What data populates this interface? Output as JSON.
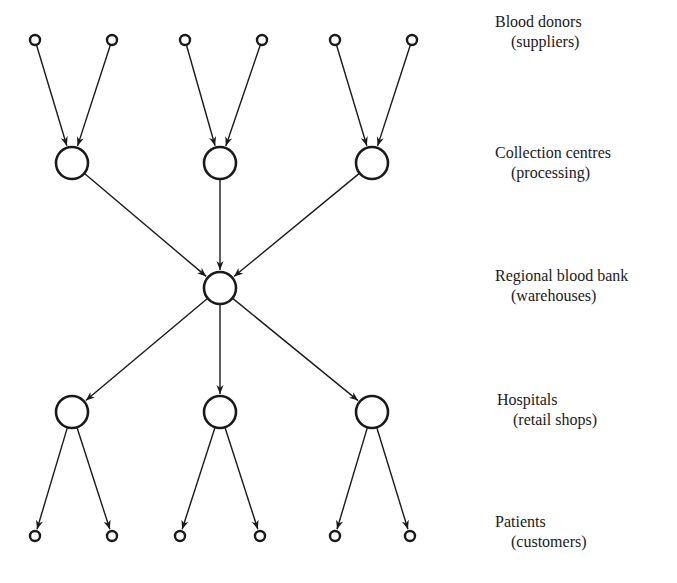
{
  "diagram": {
    "stroke_color": "#1a1a1a",
    "background": "#ffffff",
    "levels": [
      {
        "id": "donors",
        "label": "Blood donors",
        "sublabel": "(suppliers)",
        "label_x": 495,
        "label_y": 12,
        "node_size": "small",
        "y": 40,
        "xs": [
          35,
          112,
          185,
          262,
          335,
          412
        ]
      },
      {
        "id": "collection",
        "label": "Collection centres",
        "sublabel": "(processing)",
        "label_x": 495,
        "label_y": 143,
        "node_size": "large",
        "y": 163,
        "xs": [
          72,
          220,
          372
        ]
      },
      {
        "id": "regional",
        "label": "Regional blood bank",
        "sublabel": "(warehouses)",
        "label_x": 495,
        "label_y": 266,
        "node_size": "large",
        "y": 288,
        "xs": [
          220
        ]
      },
      {
        "id": "hospitals",
        "label": "Hospitals",
        "sublabel": "(retail shops)",
        "label_x": 495,
        "label_y": 390,
        "node_size": "large",
        "y": 412,
        "xs": [
          72,
          220,
          372
        ]
      },
      {
        "id": "patients",
        "label": "Patients",
        "sublabel": "(customers)",
        "label_x": 495,
        "label_y": 512,
        "node_size": "small",
        "y": 536,
        "xs": [
          35,
          112,
          180,
          260,
          335,
          410
        ]
      }
    ],
    "edges": [
      [
        "donors.0",
        "collection.0"
      ],
      [
        "donors.1",
        "collection.0"
      ],
      [
        "donors.2",
        "collection.1"
      ],
      [
        "donors.3",
        "collection.1"
      ],
      [
        "donors.4",
        "collection.2"
      ],
      [
        "donors.5",
        "collection.2"
      ],
      [
        "collection.0",
        "regional.0"
      ],
      [
        "collection.1",
        "regional.0"
      ],
      [
        "collection.2",
        "regional.0"
      ],
      [
        "regional.0",
        "hospitals.0"
      ],
      [
        "regional.0",
        "hospitals.1"
      ],
      [
        "regional.0",
        "hospitals.2"
      ],
      [
        "hospitals.0",
        "patients.0"
      ],
      [
        "hospitals.0",
        "patients.1"
      ],
      [
        "hospitals.1",
        "patients.2"
      ],
      [
        "hospitals.1",
        "patients.3"
      ],
      [
        "hospitals.2",
        "patients.4"
      ],
      [
        "hospitals.2",
        "patients.5"
      ]
    ]
  },
  "labels": {
    "donors": {
      "title": "Blood donors",
      "sub": "(suppliers)"
    },
    "collection": {
      "title": "Collection centres",
      "sub": "(processing)"
    },
    "regional": {
      "title": "Regional blood bank",
      "sub": "(warehouses)"
    },
    "hospitals": {
      "title": "Hospitals",
      "sub": "(retail shops)"
    },
    "patients": {
      "title": "Patients",
      "sub": "(customers)"
    }
  }
}
